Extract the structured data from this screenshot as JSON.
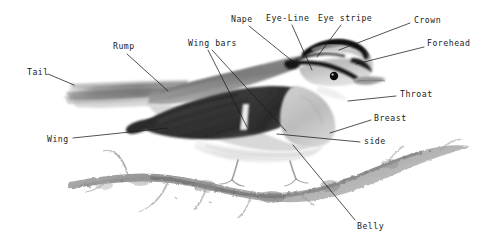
{
  "diagram": {
    "medium": "pencil / graphite sketch, grayscale",
    "background_color": "#ffffff",
    "ink_color": "#1a1a1a",
    "labels": [
      {
        "id": "tail",
        "text": "Tail",
        "x": 27,
        "y": 73,
        "anchor": "left"
      },
      {
        "id": "rump",
        "text": "Rump",
        "x": 113,
        "y": 47,
        "anchor": "left"
      },
      {
        "id": "wing_bars",
        "text": "Wing bars",
        "x": 188,
        "y": 44,
        "anchor": "left"
      },
      {
        "id": "wing",
        "text": "Wing",
        "x": 47,
        "y": 140,
        "anchor": "left"
      },
      {
        "id": "nape",
        "text": "Nape",
        "x": 231,
        "y": 20,
        "anchor": "left"
      },
      {
        "id": "eye_line",
        "text": "Eye-Line",
        "x": 268,
        "y": 19,
        "anchor": "left"
      },
      {
        "id": "eye_stripe",
        "text": "Eye stripe",
        "x": 319,
        "y": 19,
        "anchor": "left"
      },
      {
        "id": "crown",
        "text": "Crown",
        "x": 414,
        "y": 21,
        "anchor": "left"
      },
      {
        "id": "forehead",
        "text": "Forehead",
        "x": 428,
        "y": 44,
        "anchor": "left"
      },
      {
        "id": "throat",
        "text": "Throat",
        "x": 400,
        "y": 94,
        "anchor": "left"
      },
      {
        "id": "breast",
        "text": "Breast",
        "x": 374,
        "y": 118,
        "anchor": "left"
      },
      {
        "id": "side",
        "text": "side",
        "x": 364,
        "y": 141,
        "anchor": "left"
      },
      {
        "id": "belly",
        "text": "Belly",
        "x": 357,
        "y": 226,
        "anchor": "left"
      }
    ],
    "leader_lines": [
      {
        "id": "tail-leader",
        "from": [
          48,
          74
        ],
        "to": [
          74,
          85
        ]
      },
      {
        "id": "rump-leader",
        "from": [
          127,
          54
        ],
        "to": [
          168,
          91
        ]
      },
      {
        "id": "wingbars-leader-1",
        "from": [
          208,
          50
        ],
        "to": [
          247,
          127
        ]
      },
      {
        "id": "wingbars-leader-2",
        "from": [
          210,
          50
        ],
        "to": [
          285,
          131
        ]
      },
      {
        "id": "wing-leader",
        "from": [
          73,
          138
        ],
        "to": [
          168,
          128
        ]
      },
      {
        "id": "nape-leader",
        "from": [
          249,
          26
        ],
        "to": [
          296,
          64
        ]
      },
      {
        "id": "eyeline-leader",
        "from": [
          292,
          25
        ],
        "to": [
          312,
          70
        ]
      },
      {
        "id": "eyestripe-leader",
        "from": [
          341,
          25
        ],
        "to": [
          316,
          57
        ]
      },
      {
        "id": "crown-leader",
        "from": [
          410,
          23
        ],
        "to": [
          339,
          50
        ]
      },
      {
        "id": "forehead-leader",
        "from": [
          424,
          47
        ],
        "to": [
          356,
          64
        ]
      },
      {
        "id": "throat-leader",
        "from": [
          396,
          96
        ],
        "to": [
          348,
          101
        ]
      },
      {
        "id": "breast-leader",
        "from": [
          371,
          120
        ],
        "to": [
          330,
          133
        ]
      },
      {
        "id": "side-leader",
        "from": [
          360,
          142
        ],
        "to": [
          277,
          134
        ]
      },
      {
        "id": "belly-leader",
        "from": [
          355,
          220
        ],
        "to": [
          293,
          145
        ]
      }
    ],
    "anatomy_parts": [
      "Tail",
      "Rump",
      "Wing bars",
      "Wing",
      "Nape",
      "Eye-Line",
      "Eye stripe",
      "Crown",
      "Forehead",
      "Throat",
      "Breast",
      "side",
      "Belly"
    ]
  }
}
